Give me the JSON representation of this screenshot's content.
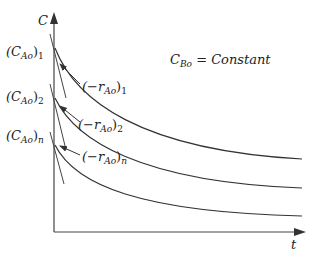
{
  "diagram": {
    "axes": {
      "y_label": "C",
      "x_label": "t"
    },
    "annotation": {
      "main": "C",
      "sub": "Bo",
      "rest": " = Constant"
    },
    "initial_conc_labels": [
      {
        "open": "(C",
        "sub": "Ao",
        "close": ")",
        "index": "1"
      },
      {
        "open": "(C",
        "sub": "Ao",
        "close": ")",
        "index": "2"
      },
      {
        "open": "(C",
        "sub": "Ao",
        "close": ")",
        "index": "n"
      }
    ],
    "rate_labels": [
      {
        "open": "(−r",
        "sub": "Ao",
        "close": ")",
        "index": "1"
      },
      {
        "open": "(−r",
        "sub": "Ao",
        "close": ")",
        "index": "2"
      },
      {
        "open": "(−r",
        "sub": "Ao",
        "close": ")",
        "index": "n"
      }
    ],
    "colors": {
      "line": "#333333",
      "background": "#ffffff"
    }
  }
}
